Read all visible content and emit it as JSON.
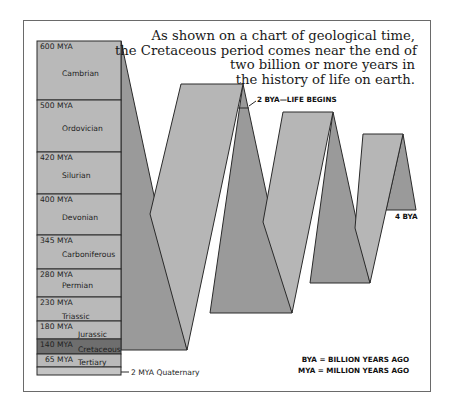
{
  "caption": {
    "lines": [
      "As shown on a chart of geological time,",
      "the Cretaceous period comes near the end of",
      "two billion or more years in",
      "the history of life on earth."
    ]
  },
  "periods": [
    {
      "mya": "600 MYA",
      "name": "Cambrian"
    },
    {
      "mya": "500 MYA",
      "name": "Ordovician"
    },
    {
      "mya": "420 MYA",
      "name": "Silurian"
    },
    {
      "mya": "400 MYA",
      "name": "Devonian"
    },
    {
      "mya": "345 MYA",
      "name": "Carboniferous"
    },
    {
      "mya": "280 MYA",
      "name": "Permian"
    },
    {
      "mya": "230 MYA",
      "name": "Triassic"
    },
    {
      "mya": "180 MYA",
      "name": "Jurassic"
    },
    {
      "mya": "140 MYA",
      "name": "Cretaceous",
      "highlight": true
    },
    {
      "mya": "65 MYA",
      "name": "Tertiary"
    }
  ],
  "annotations": {
    "quaternary": "2 MYA Quaternary",
    "life_begins": "2 BYA—LIFE BEGINS",
    "end": "4 BYA"
  },
  "legend": {
    "bya": "BYA = BILLION YEARS AGO",
    "mya": "MYA = MILLION YEARS AGO"
  },
  "colors": {
    "front_face": "#b4b4b4",
    "back_face": "#9a9a9a",
    "highlight": "#6e6e6e",
    "outline": "#2a2a2a"
  }
}
